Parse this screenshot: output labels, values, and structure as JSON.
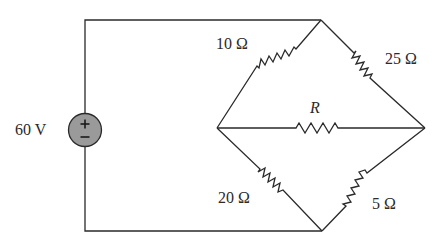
{
  "circuit": {
    "source": {
      "label": "60 V",
      "plus": "+",
      "minus": "−",
      "fill_color": "#9a9a9a"
    },
    "resistors": {
      "top_left": "10 Ω",
      "top_right": "25 Ω",
      "middle": "R",
      "bottom_left": "20 Ω",
      "bottom_right": "5 Ω"
    },
    "wire_color": "#2a2a2a"
  }
}
